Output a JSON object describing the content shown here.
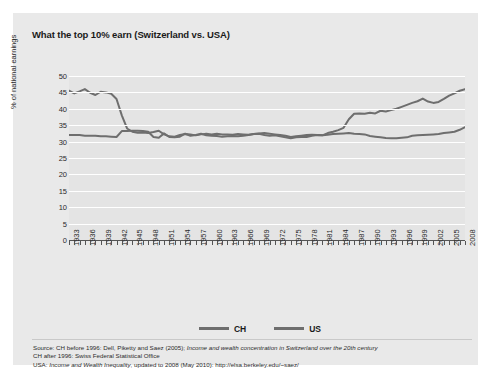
{
  "title": "What the top 10% earn (Switzerland vs. USA)",
  "axes": {
    "ylabel": "% of national earnings",
    "yticks": [
      "50",
      "45",
      "40",
      "35",
      "30",
      "25",
      "20",
      "15",
      "10",
      "5",
      "0"
    ],
    "xticks": [
      "1933",
      "1936",
      "1939",
      "1942",
      "1945",
      "1948",
      "1951",
      "1954",
      "1957",
      "1960",
      "1963",
      "1966",
      "1969",
      "1972",
      "1975",
      "1978",
      "1981",
      "1984",
      "1987",
      "1990",
      "1993",
      "1996",
      "1999",
      "2002",
      "2005",
      "2008"
    ]
  },
  "legend": {
    "items": [
      {
        "label": "CH",
        "color": "#6e6e6e"
      },
      {
        "label": "US",
        "color": "#6e6e6e"
      }
    ]
  },
  "source": {
    "line1_plain": "Source: CH before 1996: Dell, Piketty and Saez (2005); ",
    "line1_italic": "Income and wealth concentration in Switzerland over the 20th century",
    "line2": "CH after 1996: Swiss Federal Statistical Office",
    "line3_plain": "USA: ",
    "line3_italic": "Income and Wealth Inequality",
    "line3_plain2": ", updated to 2008 (May 2010): http://elsa.berkeley.edu/~saez/"
  },
  "colors": {
    "card_background": "#e9e9e9",
    "plot_background": "#e4e4e4",
    "gridline": "#ffffff",
    "line": "#6e6e6e",
    "text": "#2b2b2b"
  },
  "chart_data": {
    "type": "line",
    "title": "What the top 10% earn (Switzerland vs. USA)",
    "xlabel": "",
    "ylabel": "% of national earnings",
    "ylim": [
      0,
      50
    ],
    "xlim": [
      1933,
      2008
    ],
    "grid": true,
    "legend_position": "bottom",
    "x": [
      1933,
      1934,
      1935,
      1936,
      1937,
      1938,
      1939,
      1940,
      1941,
      1942,
      1943,
      1944,
      1945,
      1946,
      1947,
      1948,
      1949,
      1950,
      1951,
      1952,
      1953,
      1954,
      1955,
      1956,
      1957,
      1958,
      1959,
      1960,
      1961,
      1962,
      1963,
      1964,
      1965,
      1966,
      1967,
      1968,
      1969,
      1970,
      1971,
      1972,
      1973,
      1974,
      1975,
      1976,
      1977,
      1978,
      1979,
      1980,
      1981,
      1982,
      1983,
      1984,
      1985,
      1986,
      1987,
      1988,
      1989,
      1990,
      1991,
      1992,
      1993,
      1994,
      1995,
      1996,
      1997,
      1998,
      1999,
      2000,
      2001,
      2002,
      2003,
      2004,
      2005,
      2006,
      2007,
      2008
    ],
    "series": [
      {
        "name": "CH",
        "values": [
          32.0,
          32.0,
          32.0,
          31.8,
          31.8,
          31.8,
          31.6,
          31.6,
          31.5,
          31.4,
          33.2,
          33.2,
          33.3,
          33.3,
          33.2,
          33.0,
          31.4,
          31.2,
          32.5,
          31.4,
          31.3,
          31.5,
          32.4,
          31.8,
          32.0,
          32.4,
          31.9,
          31.8,
          31.7,
          31.5,
          31.6,
          31.7,
          31.6,
          31.8,
          32.0,
          32.3,
          32.5,
          32.6,
          32.4,
          32.2,
          32.0,
          31.8,
          31.4,
          31.6,
          31.8,
          32.0,
          32.1,
          32.0,
          31.9,
          32.1,
          32.3,
          32.4,
          32.5,
          32.6,
          32.4,
          32.3,
          32.2,
          31.7,
          31.5,
          31.3,
          31.1,
          31.0,
          31.0,
          31.2,
          31.3,
          31.8,
          31.9,
          32.0,
          32.1,
          32.2,
          32.3,
          32.6,
          32.8,
          33.0,
          33.6,
          34.4
        ]
      },
      {
        "name": "US",
        "values": [
          45.5,
          44.7,
          45.3,
          46.0,
          44.9,
          44.2,
          45.2,
          45.0,
          44.6,
          43.0,
          38.0,
          34.0,
          33.0,
          32.7,
          32.8,
          32.6,
          32.9,
          33.3,
          32.2,
          31.6,
          31.5,
          32.0,
          32.3,
          32.2,
          31.9,
          32.2,
          32.4,
          32.2,
          32.4,
          32.2,
          32.2,
          32.1,
          32.3,
          32.2,
          32.1,
          32.3,
          32.4,
          32.0,
          31.8,
          31.9,
          31.6,
          31.3,
          31.0,
          31.3,
          31.4,
          31.4,
          31.8,
          32.0,
          31.9,
          32.6,
          33.0,
          33.5,
          34.2,
          36.8,
          38.5,
          38.6,
          38.5,
          38.8,
          38.6,
          39.4,
          39.2,
          39.6,
          40.0,
          40.6,
          41.2,
          41.8,
          42.3,
          43.1,
          42.2,
          41.8,
          42.1,
          43.0,
          44.0,
          44.7,
          45.5,
          46.0
        ]
      }
    ]
  }
}
